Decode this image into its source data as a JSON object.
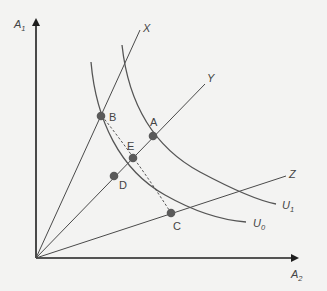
{
  "axes": {
    "y_label": "A",
    "y_sub": "1",
    "x_label": "A",
    "x_sub": "2"
  },
  "rays": [
    {
      "name": "X",
      "label": "X"
    },
    {
      "name": "Y",
      "label": "Y"
    },
    {
      "name": "Z",
      "label": "Z"
    }
  ],
  "curves": [
    {
      "name": "U0",
      "label": "U",
      "sub": "0"
    },
    {
      "name": "U1",
      "label": "U",
      "sub": "1"
    }
  ],
  "points": [
    {
      "name": "A",
      "label": "A"
    },
    {
      "name": "B",
      "label": "B"
    },
    {
      "name": "C",
      "label": "C"
    },
    {
      "name": "D",
      "label": "D"
    },
    {
      "name": "E",
      "label": "E"
    }
  ],
  "colors": {
    "background": "#f3f3f2",
    "axis": "#1e1e1e",
    "curve": "#555555",
    "point": "#5a5a5a"
  }
}
